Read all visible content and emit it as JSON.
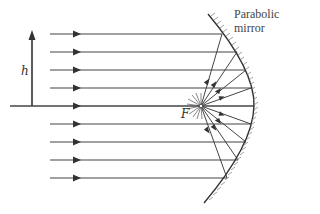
{
  "diagram": {
    "labels": {
      "height": "h",
      "focus": "F",
      "mirror_line1": "Parabolic",
      "mirror_line2": "mirror"
    },
    "colors": {
      "line": "#444444",
      "background": "#ffffff"
    },
    "focus_point": {
      "x": 201,
      "y": 106
    },
    "optical_axis_y": 106,
    "incoming_ray_count": 9,
    "ray_y_positions": [
      34,
      52,
      70,
      88,
      106,
      124,
      142,
      160,
      178
    ]
  }
}
